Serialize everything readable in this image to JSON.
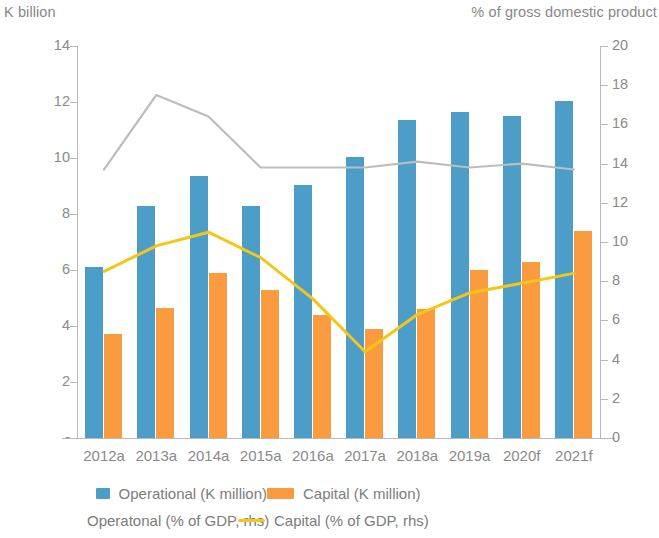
{
  "left_axis_title": "K billion",
  "right_axis_title": "% of gross domestic product",
  "legend": {
    "operational_bar": "Operational (K million)",
    "capital_bar": "Capital (K million)",
    "operational_line": "Operatonal (% of GDP, rhs)",
    "capital_line": "Capital (% of GDP, rhs)"
  },
  "colors": {
    "operational_bar": "#4d9dc9",
    "capital_bar": "#f99b3e",
    "operational_line": "#bdbdbd",
    "capital_line": "#f5c518",
    "axis": "#b9b9b9",
    "text": "#8a8a8a"
  },
  "chart_data": {
    "type": "bar",
    "title": "",
    "xlabel": "",
    "ylabel": "K billion",
    "y2label": "% of gross domestic product",
    "grid": false,
    "legend_position": "bottom",
    "categories": [
      "2012a",
      "2013a",
      "2014a",
      "2015a",
      "2016a",
      "2017a",
      "2018a",
      "2019a",
      "2020f",
      "2021f"
    ],
    "ylim": [
      0,
      14
    ],
    "y2lim": [
      0,
      20
    ],
    "yticks": [
      "-",
      "2",
      "4",
      "6",
      "8",
      "10",
      "12",
      "14"
    ],
    "ytick_values": [
      0,
      2,
      4,
      6,
      8,
      10,
      12,
      14
    ],
    "y2ticks": [
      "0",
      "2",
      "4",
      "6",
      "8",
      "10",
      "12",
      "14",
      "16",
      "18",
      "20"
    ],
    "y2tick_values": [
      0,
      2,
      4,
      6,
      8,
      10,
      12,
      14,
      16,
      18,
      20
    ],
    "series": [
      {
        "name": "Operational (K million)",
        "type": "bar",
        "axis": "left",
        "color": "#4d9dc9",
        "values": [
          6.1,
          8.3,
          9.35,
          8.3,
          9.05,
          10.05,
          11.35,
          11.65,
          11.5,
          12.05
        ]
      },
      {
        "name": "Capital (K million)",
        "type": "bar",
        "axis": "left",
        "color": "#f99b3e",
        "values": [
          3.7,
          4.65,
          5.9,
          5.3,
          4.4,
          3.9,
          4.6,
          6.0,
          6.3,
          7.4
        ]
      },
      {
        "name": "Operatonal (% of GDP, rhs)",
        "type": "line",
        "axis": "right",
        "color": "#bdbdbd",
        "values": [
          13.7,
          17.5,
          16.4,
          13.8,
          13.8,
          13.8,
          14.1,
          13.8,
          14.0,
          13.7
        ]
      },
      {
        "name": "Capital (% of GDP, rhs)",
        "type": "line",
        "axis": "right",
        "color": "#f5c518",
        "values": [
          8.5,
          9.8,
          10.5,
          9.2,
          7.1,
          4.4,
          6.3,
          7.4,
          7.9,
          8.4
        ]
      }
    ]
  }
}
